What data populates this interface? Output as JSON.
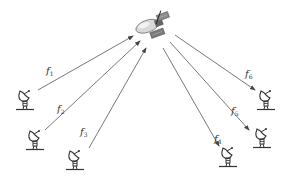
{
  "diagram": {
    "type": "satellite-uplink-downlink",
    "satellite": {
      "name": "satellite",
      "x": 155,
      "y": 28
    },
    "stations": [
      {
        "id": "s1",
        "x": 25,
        "y": 100
      },
      {
        "id": "s2",
        "x": 35,
        "y": 140
      },
      {
        "id": "s3",
        "x": 75,
        "y": 160
      },
      {
        "id": "s4",
        "x": 228,
        "y": 158
      },
      {
        "id": "s5",
        "x": 262,
        "y": 138
      },
      {
        "id": "s6",
        "x": 266,
        "y": 100
      }
    ],
    "links": [
      {
        "label": "f",
        "sub": "1",
        "direction": "uplink",
        "from": [
          38,
          90
        ],
        "to": [
          133,
          36
        ],
        "label_pos": [
          46,
          72
        ]
      },
      {
        "label": "f",
        "sub": "2",
        "direction": "uplink",
        "from": [
          45,
          130
        ],
        "to": [
          140,
          41
        ],
        "label_pos": [
          57,
          110
        ]
      },
      {
        "label": "f",
        "sub": "3",
        "direction": "uplink",
        "from": [
          89,
          148
        ],
        "to": [
          146,
          48
        ],
        "label_pos": [
          80,
          133
        ]
      },
      {
        "label": "f",
        "sub": "4",
        "direction": "downlink",
        "from": [
          163,
          48
        ],
        "to": [
          219,
          146
        ],
        "label_pos": [
          214,
          140
        ]
      },
      {
        "label": "f",
        "sub": "5",
        "direction": "downlink",
        "from": [
          170,
          42
        ],
        "to": [
          249,
          130
        ],
        "label_pos": [
          231,
          112
        ]
      },
      {
        "label": "f",
        "sub": "6",
        "direction": "downlink",
        "from": [
          175,
          35
        ],
        "to": [
          255,
          90
        ],
        "label_pos": [
          245,
          75
        ]
      }
    ],
    "colors": {
      "line": "#555555",
      "ink": "#333333"
    }
  }
}
